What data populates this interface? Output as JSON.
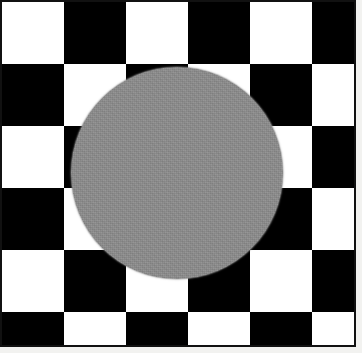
{
  "image": {
    "title": "Checkerboard circle test pattern",
    "description": "A square black-and-white diagonal checkerboard of diamond tiles with a large flat gray circle centered over it.",
    "width": 362,
    "height": 353,
    "background_color": "#f2f2f0"
  },
  "frame": {
    "name": "image-border",
    "border_color": "#111111",
    "border_width_px": 2,
    "inner_background": "#ffffff",
    "width": 356,
    "height": 347
  },
  "pattern": {
    "name": "diagonal-checkerboard",
    "type": "rotated-checkerboard",
    "light_color": "#ffffff",
    "dark_color": "#000000",
    "tile_period_px": 124,
    "diamond_half_period_px": 62,
    "orientation_deg": 45,
    "note": "Diamonds meet at pinch points near x = 52, 177, 300 and along the vertical midline y = 173."
  },
  "circle": {
    "name": "center-disc",
    "fill_color": "#8c8c8c",
    "center_x": 177,
    "center_y": 173,
    "radius": 106,
    "diameter": 212,
    "texture": "fine uniform noise / grain"
  },
  "labels": {
    "alt_text": "Black and white diamond checkerboard with a gray circle in the center"
  }
}
